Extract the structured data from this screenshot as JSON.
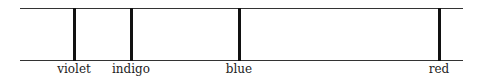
{
  "diagram": {
    "type": "spectral-lines",
    "frame": {
      "left": 20,
      "right": 463,
      "top": 8,
      "bottom": 60,
      "line_color": "#333333"
    },
    "lines": [
      {
        "label": "violet",
        "x": 74
      },
      {
        "label": "indigo",
        "x": 131
      },
      {
        "label": "blue",
        "x": 239
      },
      {
        "label": "red",
        "x": 439
      }
    ],
    "line_color": "#111111",
    "label_top": 62
  }
}
